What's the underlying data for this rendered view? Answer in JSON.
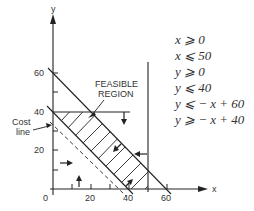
{
  "diagram": {
    "axes": {
      "x_label": "x",
      "y_label": "y",
      "x_ticks": [
        {
          "value": 0,
          "label": "0"
        },
        {
          "value": 20,
          "label": "20"
        },
        {
          "value": 40,
          "label": "40"
        },
        {
          "value": 60,
          "label": "60"
        }
      ],
      "y_ticks": [
        {
          "value": 20,
          "label": "20"
        },
        {
          "value": 40,
          "label": "40"
        },
        {
          "value": 60,
          "label": "60"
        }
      ]
    },
    "annotations": {
      "feasible_region_line1": "FEASIBLE",
      "feasible_region_line2": "REGION",
      "cost_line_line1": "Cost",
      "cost_line_line2": "line"
    },
    "constraints": [
      {
        "lhs": "x",
        "op": "≥",
        "rhs": "0"
      },
      {
        "lhs": "x",
        "op": "≤",
        "rhs": "50"
      },
      {
        "lhs": "y",
        "op": "≥",
        "rhs": "0"
      },
      {
        "lhs": "y",
        "op": "≤",
        "rhs": "40"
      },
      {
        "lhs": "y",
        "op": "≤",
        "rhs": "− x + 60"
      },
      {
        "lhs": "y",
        "op": "≥",
        "rhs": "− x + 40"
      }
    ],
    "constraint_text": [
      "x ⩾ 0",
      "x ⩽ 50",
      "y ⩾ 0",
      "y ⩽ 40",
      "y ⩽ − x + 60",
      "y ⩾ − x + 40"
    ],
    "line_color": "#222222",
    "text_color": "#333333"
  }
}
